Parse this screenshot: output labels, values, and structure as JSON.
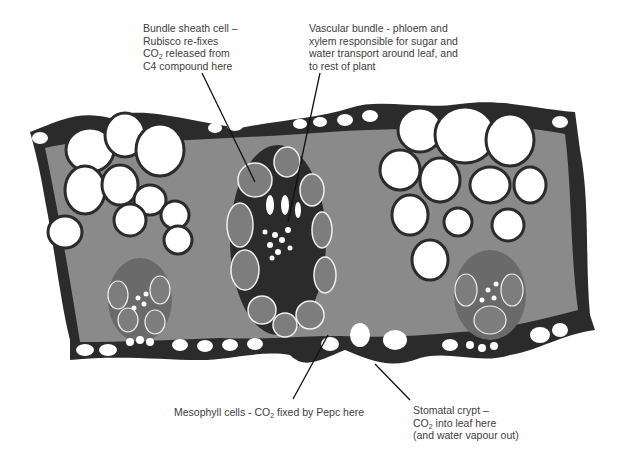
{
  "figure": {
    "colors": {
      "background": "#ffffff",
      "outline": "#2b2b2b",
      "mesophyll_gray": "#8a8a8a",
      "bundle_sheath_gray": "#7d7d7d",
      "bulliform_white": "#ffffff",
      "label_text": "#404040",
      "leader_line": "#111111"
    }
  },
  "labels": {
    "bundle_sheath": {
      "lines": [
        "Bundle sheath cell –",
        "Rubisco re-fixes",
        "CO|2| released from",
        "C4 compound here"
      ],
      "line1": "Bundle sheath cell –",
      "line2": "Rubisco re-fixes",
      "line3_pre": "CO",
      "line3_sub": "2",
      "line3_post": " released from",
      "line4": "C4 compound here"
    },
    "vascular_bundle": {
      "line1": "Vascular bundle - phloem and",
      "line2": "xylem responsible for sugar and",
      "line3": "water transport around leaf, and",
      "line4": "to rest of plant"
    },
    "mesophyll": {
      "pre": "Mesophyll cells - CO",
      "sub": "2",
      "post": " fixed by Pepc here"
    },
    "stomatal_crypt": {
      "line1": "Stomatal crypt –",
      "line2_pre": "CO",
      "line2_sub": "2",
      "line2_post": " into leaf here",
      "line3": "(and water vapour out)"
    }
  },
  "leaders": [
    {
      "name": "bundle-sheath-leader",
      "from": [
        202,
        73
      ],
      "to": [
        255,
        182
      ]
    },
    {
      "name": "vascular-bundle-leader",
      "from": [
        320,
        73
      ],
      "to": [
        288,
        222
      ]
    },
    {
      "name": "mesophyll-leader",
      "from": [
        293,
        399
      ],
      "to": [
        328,
        335
      ]
    },
    {
      "name": "stomatal-crypt-leader",
      "from": [
        410,
        400
      ],
      "to": [
        375,
        364
      ]
    }
  ]
}
